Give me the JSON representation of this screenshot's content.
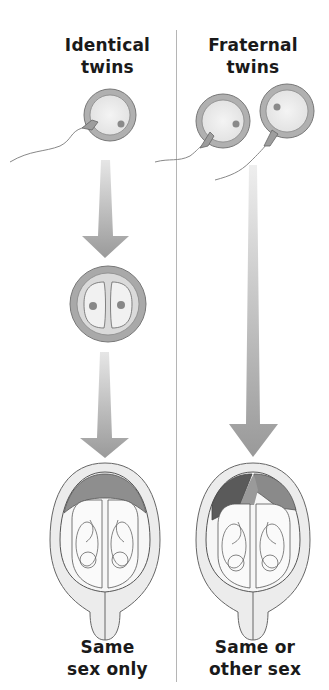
{
  "diagram": {
    "left_column": {
      "title_line1": "Identical",
      "title_line2": "twins",
      "stages": [
        "one sperm fertilizes one egg",
        "zygote splits into two cells",
        "two fetuses share one placenta"
      ],
      "outcome_line1": "Same",
      "outcome_line2": "sex only"
    },
    "right_column": {
      "title_line1": "Fraternal",
      "title_line2": "twins",
      "stages": [
        "two sperm fertilize two eggs",
        "two fetuses with separate placentas"
      ],
      "outcome_line1": "Same or",
      "outcome_line2": "other sex"
    },
    "colors": {
      "text": "#1a1a1a",
      "arrow": "#9a9a9a",
      "egg_ring": "#a8a8a8",
      "outline": "#555555",
      "placenta": "#8e8e8e",
      "divider": "#b5b5b5"
    }
  }
}
